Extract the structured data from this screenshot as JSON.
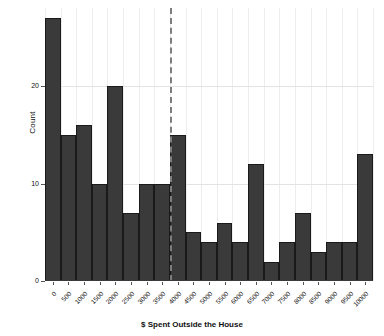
{
  "chart_data": {
    "type": "bar",
    "title": "",
    "subtitle": "",
    "xlabel": "$ Spent Outside the House",
    "ylabel": "Count",
    "categories": [
      "0",
      "500",
      "1000",
      "1500",
      "2000",
      "2500",
      "3000",
      "3500",
      "4000",
      "4500",
      "5000",
      "5500",
      "6000",
      "6500",
      "7000",
      "7500",
      "8000",
      "8500",
      "9000",
      "9500",
      "10000"
    ],
    "values": [
      27,
      15,
      16,
      10,
      20,
      7,
      10,
      10,
      15,
      5,
      4,
      6,
      4,
      12,
      2,
      4,
      7,
      3,
      4,
      4,
      13
    ],
    "bin_width": 500,
    "x_tick_labels": [
      "0",
      "500",
      "1000",
      "1500",
      "2000",
      "2500",
      "3000",
      "3500",
      "4000",
      "4500",
      "5000",
      "5500",
      "6000",
      "6500",
      "7000",
      "7500",
      "8000",
      "8500",
      "9000",
      "9500",
      "10000"
    ],
    "y_tick_labels": [
      "0",
      "10",
      "20"
    ],
    "y_tick_values": [
      0,
      10,
      20
    ],
    "ylim": [
      0,
      28
    ],
    "xlim": [
      0,
      10500
    ],
    "grid": true,
    "legend": "none",
    "annotations": [
      {
        "name": "threshold-line",
        "type": "vertical-dashed-line",
        "x": 4000,
        "style": "dashed",
        "color": "#7d7d7d"
      }
    ],
    "bar_color": "#3a3a3a",
    "bar_edge_color": "#1a1a1a",
    "grid_color": "#e3e3e3",
    "background_color": "#ffffff"
  }
}
